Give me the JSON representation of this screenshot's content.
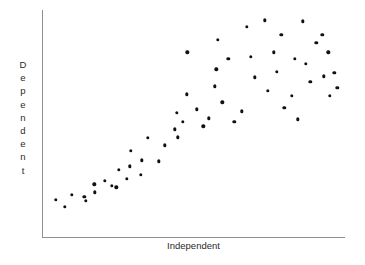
{
  "chart": {
    "title": "",
    "xlabel": "Independent",
    "ylabel": "Dependent",
    "ylabel_letters": [
      "D",
      "e",
      "p",
      "e",
      "n",
      "d",
      "e",
      "n",
      "t"
    ],
    "dot_color": "#111111",
    "axis_color": "#8e8e8e",
    "background_color": "#ffffff"
  },
  "chart_data": {
    "type": "scatter",
    "title": "",
    "xlabel": "Independent",
    "ylabel": "Dependent",
    "grid": false,
    "legend": false,
    "axis_ticks": false,
    "xlim": [
      0,
      100
    ],
    "ylim": [
      0,
      100
    ],
    "series": [
      {
        "name": "observations",
        "color": "#111111",
        "points": [
          {
            "x": 4.6,
            "y": 16.8
          },
          {
            "x": 7.6,
            "y": 13.6
          },
          {
            "x": 9.9,
            "y": 19.0
          },
          {
            "x": 13.9,
            "y": 18.1
          },
          {
            "x": 14.5,
            "y": 16.2
          },
          {
            "x": 17.2,
            "y": 23.5
          },
          {
            "x": 17.5,
            "y": 20.0
          },
          {
            "x": 20.8,
            "y": 25.0
          },
          {
            "x": 23.1,
            "y": 23.0
          },
          {
            "x": 24.5,
            "y": 22.2
          },
          {
            "x": 25.4,
            "y": 30.0
          },
          {
            "x": 28.0,
            "y": 26.0
          },
          {
            "x": 29.0,
            "y": 31.5
          },
          {
            "x": 29.3,
            "y": 38.2
          },
          {
            "x": 32.7,
            "y": 27.8
          },
          {
            "x": 33.0,
            "y": 34.0
          },
          {
            "x": 35.0,
            "y": 44.0
          },
          {
            "x": 38.6,
            "y": 33.6
          },
          {
            "x": 40.6,
            "y": 40.6
          },
          {
            "x": 43.9,
            "y": 47.6
          },
          {
            "x": 44.5,
            "y": 55.0
          },
          {
            "x": 44.8,
            "y": 44.2
          },
          {
            "x": 46.5,
            "y": 51.0
          },
          {
            "x": 47.8,
            "y": 63.0
          },
          {
            "x": 48.0,
            "y": 81.5
          },
          {
            "x": 51.0,
            "y": 56.5
          },
          {
            "x": 53.2,
            "y": 49.0
          },
          {
            "x": 55.0,
            "y": 52.5
          },
          {
            "x": 57.0,
            "y": 66.5
          },
          {
            "x": 57.5,
            "y": 74.0
          },
          {
            "x": 58.0,
            "y": 87.0
          },
          {
            "x": 59.5,
            "y": 59.5
          },
          {
            "x": 61.5,
            "y": 78.5
          },
          {
            "x": 63.5,
            "y": 51.0
          },
          {
            "x": 66.0,
            "y": 55.5
          },
          {
            "x": 67.5,
            "y": 92.5
          },
          {
            "x": 69.0,
            "y": 79.5
          },
          {
            "x": 70.2,
            "y": 70.5
          },
          {
            "x": 73.5,
            "y": 95.5
          },
          {
            "x": 74.5,
            "y": 64.5
          },
          {
            "x": 76.5,
            "y": 81.5
          },
          {
            "x": 77.5,
            "y": 73.0
          },
          {
            "x": 79.0,
            "y": 89.0
          },
          {
            "x": 80.0,
            "y": 57.0
          },
          {
            "x": 82.5,
            "y": 62.5
          },
          {
            "x": 83.5,
            "y": 78.5
          },
          {
            "x": 84.5,
            "y": 52.0
          },
          {
            "x": 86.0,
            "y": 95.0
          },
          {
            "x": 87.0,
            "y": 76.5
          },
          {
            "x": 88.5,
            "y": 68.5
          },
          {
            "x": 90.5,
            "y": 85.5
          },
          {
            "x": 92.5,
            "y": 89.0
          },
          {
            "x": 93.0,
            "y": 71.0
          },
          {
            "x": 94.5,
            "y": 81.5
          },
          {
            "x": 95.0,
            "y": 62.5
          },
          {
            "x": 96.5,
            "y": 72.5
          },
          {
            "x": 97.5,
            "y": 66.0
          }
        ]
      }
    ]
  }
}
